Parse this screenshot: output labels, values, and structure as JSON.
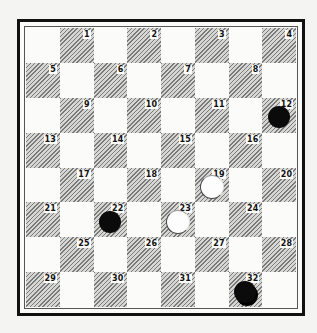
{
  "diagram": {
    "type": "checkers-board",
    "squares": [
      "1",
      "2",
      "3",
      "4",
      "5",
      "6",
      "7",
      "8",
      "9",
      "10",
      "11",
      "12",
      "13",
      "14",
      "15",
      "16",
      "17",
      "18",
      "19",
      "20",
      "21",
      "22",
      "23",
      "24",
      "25",
      "26",
      "27",
      "28",
      "29",
      "30",
      "31",
      "32"
    ],
    "pieces": [
      {
        "square": 12,
        "color": "black",
        "king": false
      },
      {
        "square": 19,
        "color": "white",
        "king": false
      },
      {
        "square": 22,
        "color": "black",
        "king": false
      },
      {
        "square": 23,
        "color": "white",
        "king": false
      },
      {
        "square": 32,
        "color": "black",
        "king": true
      }
    ]
  }
}
